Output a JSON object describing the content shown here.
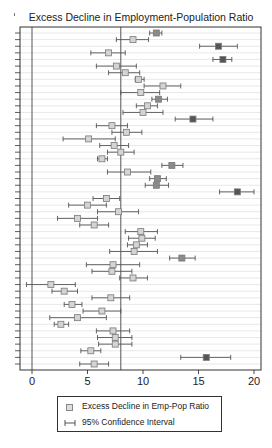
{
  "chart_data": {
    "type": "scatter",
    "subtype": "forest_plot_horizontal_ci",
    "title": "Excess Decline in Employment-Population Ratio",
    "xlabel": "",
    "ylabel": "",
    "xlim": [
      -1.2,
      20.6
    ],
    "xticks": [
      0,
      5,
      10,
      15,
      20
    ],
    "xtick_labels": [
      "0",
      "5",
      "10",
      "15",
      "20"
    ],
    "reference_lines": [
      {
        "axis": "x",
        "value": 0,
        "style": "solid"
      },
      {
        "axis": "x",
        "value": 8.0,
        "style": "solid"
      }
    ],
    "grid": {
      "horizontal": true,
      "vertical": false
    },
    "legend": {
      "position": "bottom",
      "entries": [
        {
          "label": "Excess Decline in Emp-Pop Ratio",
          "symbol": "square"
        },
        {
          "label": "95% Confidence Interval",
          "symbol": "capped-line"
        }
      ]
    },
    "series": [
      {
        "name": "Excess Decline in Emp-Pop Ratio",
        "rows": [
          {
            "row": 1,
            "value": 11.2,
            "ci_low": 10.6,
            "ci_high": 11.7,
            "shade": "mid"
          },
          {
            "row": 2,
            "value": 9.1,
            "ci_low": 7.6,
            "ci_high": 10.5,
            "shade": "light"
          },
          {
            "row": 3,
            "value": 16.8,
            "ci_low": 15.1,
            "ci_high": 18.5,
            "shade": "dark"
          },
          {
            "row": 4,
            "value": 6.9,
            "ci_low": 5.3,
            "ci_high": 8.4,
            "shade": "light"
          },
          {
            "row": 5,
            "value": 17.2,
            "ci_low": 16.3,
            "ci_high": 18.0,
            "shade": "dark"
          },
          {
            "row": 6,
            "value": 7.6,
            "ci_low": 5.8,
            "ci_high": 9.4,
            "shade": "light"
          },
          {
            "row": 7,
            "value": 8.4,
            "ci_low": 6.9,
            "ci_high": 9.7,
            "shade": "light"
          },
          {
            "row": 8,
            "value": 9.6,
            "ci_low": 9.3,
            "ci_high": 10.1,
            "shade": "light"
          },
          {
            "row": 9,
            "value": 11.8,
            "ci_low": 10.1,
            "ci_high": 13.4,
            "shade": "light"
          },
          {
            "row": 10,
            "value": 9.8,
            "ci_low": 8.0,
            "ci_high": 11.5,
            "shade": "light"
          },
          {
            "row": 11,
            "value": 11.4,
            "ci_low": 10.8,
            "ci_high": 12.2,
            "shade": "mid"
          },
          {
            "row": 12,
            "value": 10.4,
            "ci_low": 9.4,
            "ci_high": 11.3,
            "shade": "light"
          },
          {
            "row": 13,
            "value": 10.0,
            "ci_low": 8.2,
            "ci_high": 11.8,
            "shade": "light"
          },
          {
            "row": 14,
            "value": 14.5,
            "ci_low": 12.9,
            "ci_high": 16.3,
            "shade": "dark"
          },
          {
            "row": 15,
            "value": 7.2,
            "ci_low": 5.8,
            "ci_high": 8.6,
            "shade": "light"
          },
          {
            "row": 16,
            "value": 8.5,
            "ci_low": 7.2,
            "ci_high": 9.9,
            "shade": "light"
          },
          {
            "row": 17,
            "value": 5.1,
            "ci_low": 2.8,
            "ci_high": 7.5,
            "shade": "light"
          },
          {
            "row": 18,
            "value": 7.4,
            "ci_low": 6.1,
            "ci_high": 8.7,
            "shade": "light"
          },
          {
            "row": 19,
            "value": 8.0,
            "ci_low": 6.8,
            "ci_high": 9.2,
            "shade": "light"
          },
          {
            "row": 20,
            "value": 6.3,
            "ci_low": 5.9,
            "ci_high": 6.8,
            "shade": "light"
          },
          {
            "row": 21,
            "value": 12.6,
            "ci_low": 11.7,
            "ci_high": 13.6,
            "shade": "mid"
          },
          {
            "row": 22,
            "value": 8.6,
            "ci_low": 6.8,
            "ci_high": 10.7,
            "shade": "light"
          },
          {
            "row": 23,
            "value": 11.3,
            "ci_low": 10.6,
            "ci_high": 12.1,
            "shade": "mid"
          },
          {
            "row": 24,
            "value": 11.2,
            "ci_low": 10.2,
            "ci_high": 12.3,
            "shade": "mid"
          },
          {
            "row": 25,
            "value": 18.5,
            "ci_low": 16.9,
            "ci_high": 20.0,
            "shade": "dark"
          },
          {
            "row": 26,
            "value": 6.7,
            "ci_low": 5.5,
            "ci_high": 7.9,
            "shade": "light"
          },
          {
            "row": 27,
            "value": 5.0,
            "ci_low": 3.3,
            "ci_high": 6.7,
            "shade": "light"
          },
          {
            "row": 28,
            "value": 7.8,
            "ci_low": 5.9,
            "ci_high": 9.6,
            "shade": "light"
          },
          {
            "row": 29,
            "value": 4.1,
            "ci_low": 2.3,
            "ci_high": 5.9,
            "shade": "light"
          },
          {
            "row": 30,
            "value": 5.6,
            "ci_low": 4.3,
            "ci_high": 6.9,
            "shade": "light"
          },
          {
            "row": 31,
            "value": 9.8,
            "ci_low": 8.4,
            "ci_high": 11.3,
            "shade": "light"
          },
          {
            "row": 32,
            "value": 9.9,
            "ci_low": 8.7,
            "ci_high": 11.1,
            "shade": "light"
          },
          {
            "row": 33,
            "value": 9.4,
            "ci_low": 8.6,
            "ci_high": 10.4,
            "shade": "light"
          },
          {
            "row": 34,
            "value": 9.2,
            "ci_low": 7.0,
            "ci_high": 11.3,
            "shade": "light"
          },
          {
            "row": 35,
            "value": 13.5,
            "ci_low": 12.4,
            "ci_high": 14.7,
            "shade": "mid"
          },
          {
            "row": 36,
            "value": 7.3,
            "ci_low": 4.9,
            "ci_high": 9.7,
            "shade": "light"
          },
          {
            "row": 37,
            "value": 7.2,
            "ci_low": 5.4,
            "ci_high": 9.0,
            "shade": "light"
          },
          {
            "row": 38,
            "value": 9.1,
            "ci_low": 7.9,
            "ci_high": 10.4,
            "shade": "light"
          },
          {
            "row": 39,
            "value": 1.7,
            "ci_low": -0.5,
            "ci_high": 3.9,
            "shade": "light"
          },
          {
            "row": 40,
            "value": 2.9,
            "ci_low": 1.8,
            "ci_high": 4.1,
            "shade": "light"
          },
          {
            "row": 41,
            "value": 7.1,
            "ci_low": 5.4,
            "ci_high": 8.8,
            "shade": "light"
          },
          {
            "row": 42,
            "value": 3.6,
            "ci_low": 2.9,
            "ci_high": 4.5,
            "shade": "light"
          },
          {
            "row": 43,
            "value": 6.3,
            "ci_low": 4.6,
            "ci_high": 8.0,
            "shade": "light"
          },
          {
            "row": 44,
            "value": 4.1,
            "ci_low": 1.6,
            "ci_high": 6.7,
            "shade": "light"
          },
          {
            "row": 45,
            "value": 2.6,
            "ci_low": 2.0,
            "ci_high": 3.3,
            "shade": "light"
          },
          {
            "row": 46,
            "value": 7.3,
            "ci_low": 5.8,
            "ci_high": 8.8,
            "shade": "light"
          },
          {
            "row": 47,
            "value": 7.5,
            "ci_low": 5.9,
            "ci_high": 9.0,
            "shade": "light"
          },
          {
            "row": 48,
            "value": 7.5,
            "ci_low": 6.0,
            "ci_high": 9.0,
            "shade": "light"
          },
          {
            "row": 49,
            "value": 5.3,
            "ci_low": 4.4,
            "ci_high": 6.2,
            "shade": "light"
          },
          {
            "row": 50,
            "value": 15.7,
            "ci_low": 13.4,
            "ci_high": 17.9,
            "shade": "dark"
          },
          {
            "row": 51,
            "value": 5.6,
            "ci_low": 4.3,
            "ci_high": 6.9,
            "shade": "light"
          }
        ]
      }
    ]
  },
  "colors": {
    "frame": "#333333",
    "gridline": "#e2e2e2",
    "reference_line": "#555555",
    "ci_line": "#555555",
    "shade_dark": "#555555",
    "shade_mid": "#8a8a8a",
    "shade_light": "#d4d4d4",
    "box_border": "#7a7a7a"
  },
  "layout": {
    "frame": {
      "left": 20,
      "top": 27,
      "right": 261,
      "bottom": 370
    },
    "x_zero_px": 32,
    "px_per_unit": 11.1,
    "first_row_y": 33,
    "row_spacing": 6.62
  }
}
